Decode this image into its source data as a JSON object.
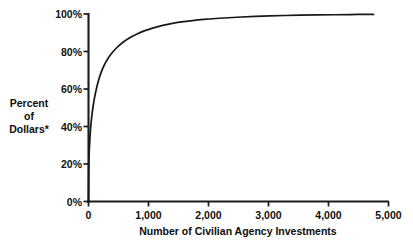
{
  "chart_data": {
    "type": "line",
    "title": "",
    "subtitle": "",
    "xlabel": "Number of Civilian Agency Investments",
    "ylabel": "Percent of Dollars*",
    "ylabel_lines": [
      "Percent",
      "of",
      "Dollars*"
    ],
    "xlim": [
      0,
      5000
    ],
    "ylim": [
      0,
      100
    ],
    "grid": false,
    "legend": null,
    "legend_position": "none",
    "xtick_labels": [
      "0",
      "1,000",
      "2,000",
      "3,000",
      "4,000",
      "5,000"
    ],
    "xtick_values": [
      0,
      1000,
      2000,
      3000,
      4000,
      5000
    ],
    "ytick_labels": [
      "0%",
      "20%",
      "40%",
      "60%",
      "80%",
      "100%"
    ],
    "ytick_values": [
      0,
      20,
      40,
      60,
      80,
      100
    ],
    "series": [
      {
        "name": "Cumulative percent of dollars",
        "color": "#181818",
        "x": [
          0,
          5,
          15,
          30,
          50,
          80,
          120,
          170,
          230,
          300,
          380,
          470,
          570,
          680,
          800,
          930,
          1070,
          1220,
          1380,
          1550,
          1730,
          1920,
          2120,
          2330,
          2550,
          2780,
          3020,
          3270,
          3530,
          3800,
          4080,
          4370,
          4670,
          4750
        ],
        "y": [
          0,
          20.5,
          28.5,
          37.0,
          44.0,
          51.5,
          58.5,
          65.0,
          70.5,
          75.0,
          78.8,
          82.0,
          84.8,
          87.2,
          89.2,
          91.0,
          92.5,
          93.8,
          94.9,
          95.8,
          96.5,
          97.1,
          97.6,
          98.0,
          98.4,
          98.7,
          99.0,
          99.2,
          99.35,
          99.5,
          99.6,
          99.7,
          99.8,
          99.8
        ]
      }
    ],
    "annotations": [],
    "footnote_marker": "*"
  },
  "axes": {
    "x_axis_name": "x-axis",
    "y_axis_name": "y-axis"
  }
}
